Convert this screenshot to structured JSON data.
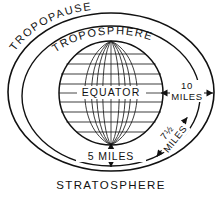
{
  "diagram": {
    "title_implied": "Earth atmosphere layers cross-section",
    "background_color": "#ffffff",
    "line_color": "#111111",
    "labels": {
      "tropopause": "TROPOPAUSE",
      "troposphere": "TROPOSPHERE",
      "stratosphere": "STRATOSPHERE",
      "equator": "EQUATOR",
      "dim_right_value": "10",
      "dim_right_unit": "MILES",
      "dim_diag": "7½ MILES",
      "dim_diag_value": "7½",
      "dim_diag_unit": "MILES",
      "dim_bottom": "5 MILES"
    },
    "measurements": [
      {
        "name": "equatorial-thickness",
        "value": "10",
        "unit": "MILES",
        "position": "right"
      },
      {
        "name": "mid-latitude-thickness",
        "value": "7½",
        "unit": "MILES",
        "position": "lower-right-diagonal"
      },
      {
        "name": "polar-thickness",
        "value": "5",
        "unit": "MILES",
        "position": "bottom"
      }
    ],
    "globe": {
      "center_x": 111,
      "center_y": 93,
      "radius": 52,
      "meridian_count": 9,
      "latitude_count": 9
    },
    "ellipses": {
      "outer": {
        "cx": 111,
        "cy": 92,
        "rx": 103,
        "ry": 79
      },
      "inner": {
        "cx": 111,
        "cy": 96,
        "rx": 89,
        "ry": 70
      }
    }
  }
}
